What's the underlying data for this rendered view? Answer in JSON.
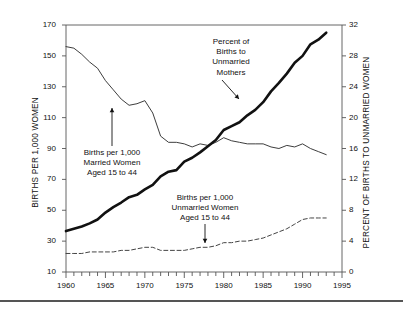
{
  "chart_data": {
    "type": "line",
    "title": "",
    "xlabel": "",
    "ylabel": "BIRTHS PER 1,000 WOMEN",
    "y2label": "PERCENT OF BIRTHS TO UNMARRIED WOMEN",
    "xlim": [
      1960,
      1995
    ],
    "ylim": [
      10,
      170
    ],
    "y2lim": [
      0,
      32
    ],
    "grid": false,
    "legend_position": "inline-annotations",
    "xticks": [
      "1960",
      "1965",
      "1970",
      "1975",
      "1980",
      "1985",
      "1990",
      "1995"
    ],
    "xtick_values": [
      1960,
      1965,
      1970,
      1975,
      1980,
      1985,
      1990,
      1995
    ],
    "xminor_step": 1,
    "yticks": [
      "10",
      "30",
      "50",
      "70",
      "90",
      "110",
      "130",
      "150",
      "170"
    ],
    "ytick_values": [
      10,
      30,
      50,
      70,
      90,
      110,
      130,
      150,
      170
    ],
    "y2ticks": [
      "0",
      "4",
      "8",
      "12",
      "16",
      "20",
      "24",
      "28",
      "32"
    ],
    "y2tick_values": [
      0,
      4,
      8,
      12,
      16,
      20,
      24,
      28,
      32
    ],
    "x": [
      1960,
      1961,
      1962,
      1963,
      1964,
      1965,
      1966,
      1967,
      1968,
      1969,
      1970,
      1971,
      1972,
      1973,
      1974,
      1975,
      1976,
      1977,
      1978,
      1979,
      1980,
      1981,
      1982,
      1983,
      1984,
      1985,
      1986,
      1987,
      1988,
      1989,
      1990,
      1991,
      1992,
      1993
    ],
    "series": [
      {
        "name": "Births per 1,000 Married Women Aged 15 to 44",
        "axis": "left",
        "style": "thin-solid",
        "color": "#333333",
        "values": [
          156,
          155,
          151,
          146,
          142,
          134,
          128,
          122,
          118,
          119,
          121,
          113,
          98,
          94,
          94,
          93,
          91,
          93,
          92,
          94,
          97,
          95,
          94,
          93,
          93,
          93,
          91,
          90,
          92,
          91,
          93,
          90,
          88,
          86
        ]
      },
      {
        "name": "Births per 1,000 Unmarried Women Aged 15 to 44",
        "axis": "left",
        "style": "dashed",
        "color": "#444444",
        "values": [
          22,
          22,
          22,
          23,
          23,
          23,
          23,
          24,
          24,
          25,
          26,
          26,
          24,
          24,
          24,
          24,
          25,
          26,
          26,
          27,
          29,
          29,
          30,
          30,
          31,
          32,
          34,
          36,
          38,
          41,
          44,
          45,
          45,
          45
        ]
      },
      {
        "name": "Percent of Births to Unmarried Mothers",
        "axis": "right",
        "style": "thick-solid",
        "color": "#111111",
        "values": [
          5.3,
          5.6,
          5.9,
          6.3,
          6.8,
          7.7,
          8.4,
          9.0,
          9.7,
          10.0,
          10.7,
          11.3,
          12.4,
          13.0,
          13.2,
          14.3,
          14.8,
          15.5,
          16.3,
          17.1,
          18.4,
          18.9,
          19.4,
          20.3,
          21.0,
          22.0,
          23.4,
          24.5,
          25.7,
          27.1,
          28.0,
          29.5,
          30.1,
          31.0
        ]
      }
    ],
    "annotations": [
      {
        "name": "married-women-annotation",
        "lines": [
          "Births per 1,000",
          "Married Women",
          "Aged 15 to 44"
        ],
        "arrow": "up"
      },
      {
        "name": "unmarried-women-annotation",
        "lines": [
          "Births per 1,000",
          "Unmarried Women",
          "Aged 15 to 44"
        ],
        "arrow": "down"
      },
      {
        "name": "percent-unmarried-mothers-annotation",
        "lines": [
          "Percent of",
          "Births to",
          "Unmarried",
          "Mothers"
        ],
        "arrow": "down-right"
      }
    ]
  },
  "axes": {
    "left_title": "BIRTHS PER 1,000 WOMEN",
    "right_title": "PERCENT OF BIRTHS TO UNMARRIED WOMEN"
  },
  "annotation_text": {
    "married": {
      "line1": "Births per 1,000",
      "line2": "Married Women",
      "line3": "Aged 15 to 44"
    },
    "unmarried": {
      "line1": "Births per 1,000",
      "line2": "Unmarried Women",
      "line3": "Aged 15 to 44"
    },
    "percent": {
      "line1": "Percent of",
      "line2": "Births to",
      "line3": "Unmarried",
      "line4": "Mothers"
    }
  },
  "colors": {
    "axis": "#555555",
    "thin_line": "#333333",
    "dashed_line": "#444444",
    "thick_line": "#111111",
    "text": "#111111"
  }
}
